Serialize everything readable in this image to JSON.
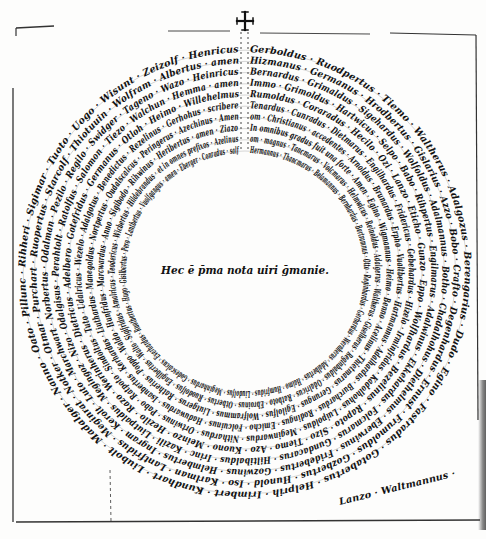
{
  "document": {
    "title": "Circular name diagram (manuscript)",
    "center_inscription": "Hec ē p̄ma nota uiri ḡmanie.",
    "cross_glyph": "✠",
    "colors": {
      "ink": "#111111",
      "paper": "#fdfdfc",
      "rule": "#333333"
    }
  },
  "diagram": {
    "center": {
      "x": 245,
      "y": 272
    },
    "inner_radius": 115,
    "ring_step": 11.2,
    "ring_count": 10,
    "rings": [
      {
        "text": "Hermannus · Thancmarus · Belamannus · Bernhardus · Bertramnus · Otto · Reginhardus · Gerhardus · Wernherus · Adalbertus · Haimo · Humfridus · Liudolfus · Meginhardus · Godescalcus · Everhardus · Ruotbertus · Hugo · Gisilbertus · Pero · Lantbertus · Vuolfgangus · amen · Eberger · Conradus · salf"
      },
      {
        "text": "om · magnus · Tancmarus · Volcmarus · Helmwicus · Reinoldus · Adalgerus · Waltherus · Giselherus · Reginbaldus · Odalricus · Ratboto · Ebroinus · Otbertus · Ruodolfus · Engilbertus · Walto · Sigifridus · Amalricus · Teodericus · Wicbertus · Hildebrandus · et in omnes prefixos · Azelinus"
      },
      {
        "text": "In omnibus gradus fuit una forte · Amen · Egino · Wigmannus · Heimo · Benno · Acelinus · Thietmarus · Gerungus · Egilolfus · Wolframmus · Liutgerus · Ratherius · Poppo · Waldo · Hunfridus · Marcwardus · Anno · Sigibodo · Rihwinus · Heribertus · amen · Ziazo"
      },
      {
        "text": "om · Christianus · accedentes · Arnoldus · Brunardus · Erpho · Vualtbertus · Hartmannus · Adalhardus · Burchardus · Rodingus · Emicho · Folcuinus · Haduwardus · Isanbertus · Kerhardus · Liuthardus · Manegoldus · Nortpertus · Oudalscalcus · Peringerus · Azechinus · Amen"
      },
      {
        "text": "Tenardus · Cunradus · Dietmarus · Engilhardus · Fridericus · Gebehardus · Hizelo · Irminfridus · Kadolhohus · Luipoldus · Meginwardus · Nithardus · Ortwinus · Pabo · Ratpoto · Sindoltus · Tuto · Udalricus · Wezelo · Adalgotus · Benedictus · Rezelinus · Gerhohus · scribere"
      },
      {
        "text": "Rumoldus · Coraradus · Hecilo · Ozi · Lanzo · Eticho · Gunzo · Eppo · Wolfhardus · Bezelinus · Rapoto · Sizo · Tiemo · Azo · Kuono · Meinzo · Hezilo · Razo · Werinherus · Dietricus · Adelbero · Gotefridus · Germanus · Otloh · Heimo · Willehelmus"
      },
      {
        "text": "Immo · Grimoldus · Hartwicus · Selpo · Babo · Rihpertus · Engilmarus · Adalwinus · Ekkehardus · Folcmarus · Gundacarus · Hiltibaldus · Irinc · Kazili · Liutpaldus · Megingoz · Nizo · Odalgisus · Perahtolt · Ratolfus · Salomon · Tiezo · Walchun · Hemma · amen"
      },
      {
        "text": "Bernardus · Grimaldus · Sigehardus · Wolfoldus · Adalmannus · Botho · Chadalhohus · Diethelmus · Eberwinus · Fridebertus · Gozwinus · Helmbertus · Ingram · Kerolt · Luto · Marchwart · Norbertus · Odalman · Pezilo · Regilo · Swidger · Tageno · Wazo · Heinricus"
      },
      {
        "text": "Hizmanus · Germanus · Hrodbertus · Gislarius · Azzo · Bobo · Crafto · Degenhardus · Ernust · Frumoldus · Gozbertus · Hunold · Iso · Karlman · Lantfridus · Meginrat · Notker · Otmar · Purchart · Ruopertus · Starcolf · Thiotuuin · Wolfram · Albertus · amen"
      },
      {
        "text": "Gerboldus · Ruodpertus · Tiemo · Waltherus · Adalgozus · Berengarius · Dudo · Egino · Fastradus · Gotabertus · Helprih · Irimbert · Kundhart · Liubolt · Madalger · Nanno · Oato · Pillunc · Rihheri · Sigimar · Tuoto · Uogo · Wisunt · Zeizolf · Henricus"
      }
    ],
    "trailing_lines": [
      {
        "text": "Lanzo · Waltmannus ·"
      },
      {
        "text": "Lemmo · Hartmannus ·"
      }
    ],
    "divider": {
      "label": "vertical-dotted-rule",
      "x": 245
    }
  }
}
